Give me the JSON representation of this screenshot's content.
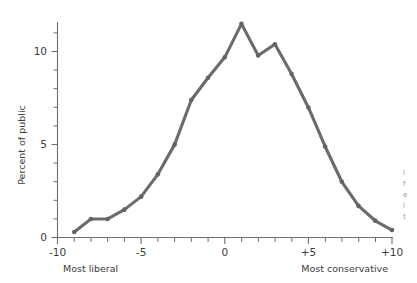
{
  "chart_data": {
    "type": "line",
    "title": "",
    "xlabel": "",
    "ylabel": "Percent of public",
    "xlim": [
      -10,
      10
    ],
    "ylim": [
      0,
      12
    ],
    "grid": false,
    "legend": null,
    "x": [
      -9,
      -8,
      -7,
      -6,
      -5,
      -4,
      -3,
      -2,
      -1,
      0,
      1,
      2,
      3,
      4,
      5,
      6,
      7,
      8,
      9,
      10
    ],
    "values": [
      0.3,
      1.0,
      1.0,
      1.5,
      2.2,
      3.4,
      5.0,
      7.4,
      8.6,
      9.7,
      11.5,
      9.8,
      10.4,
      8.8,
      7.0,
      4.9,
      3.0,
      1.7,
      0.9,
      0.4
    ],
    "x_tick_labels": [
      "-10",
      "-5",
      "0",
      "+5",
      "+10"
    ],
    "x_tick_values": [
      -10,
      -5,
      0,
      5,
      10
    ],
    "x_minor_step": 1,
    "y_tick_labels": [
      "0",
      "5",
      "10"
    ],
    "y_tick_values": [
      0,
      5,
      10
    ],
    "y_minor_step": 1,
    "x_end_label_left": "Most liberal",
    "x_end_label_right": "Most conservative",
    "line_color": "#6b6b6b",
    "axis_color": "#6e6e6e"
  },
  "axis": {
    "y_title": "Percent of public",
    "left_anchor_label": "Most liberal",
    "right_anchor_label": "Most conservative"
  },
  "edge_fragments": [
    "l",
    "f",
    "e",
    "l",
    "t"
  ]
}
